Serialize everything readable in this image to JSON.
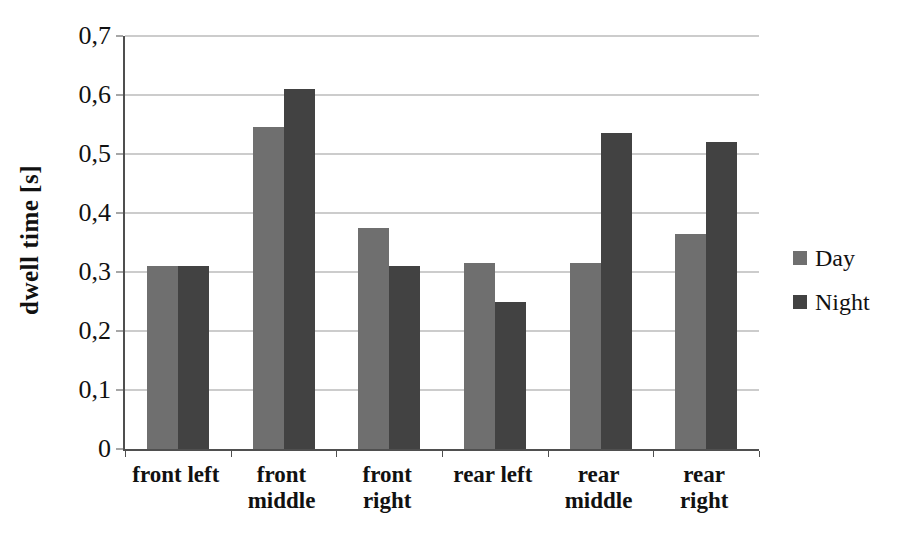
{
  "page": {
    "background": "#ffffff"
  },
  "chart_data": {
    "type": "bar",
    "title": "",
    "xlabel": "",
    "ylabel": "dwell time [s]",
    "categories": [
      "front left",
      "front middle",
      "front right",
      "rear left",
      "rear middle",
      "rear right"
    ],
    "series": [
      {
        "name": "Day",
        "color": "#6f6f6f",
        "values": [
          0.31,
          0.545,
          0.375,
          0.315,
          0.315,
          0.365
        ]
      },
      {
        "name": "Night",
        "color": "#424242",
        "values": [
          0.31,
          0.61,
          0.31,
          0.25,
          0.535,
          0.52
        ]
      }
    ],
    "ylim": [
      0,
      0.7
    ],
    "ytick_step": 0.1,
    "ytick_labels": [
      "0",
      "0,1",
      "0,2",
      "0,3",
      "0,4",
      "0,5",
      "0,6",
      "0,7"
    ],
    "decimal_separator": ",",
    "grid": "horizontal",
    "legend_position": "right",
    "colors": {
      "gridline": "#9a9a9a",
      "axis": "#4f4f4f",
      "text": "#111111",
      "background": "#ffffff"
    }
  }
}
